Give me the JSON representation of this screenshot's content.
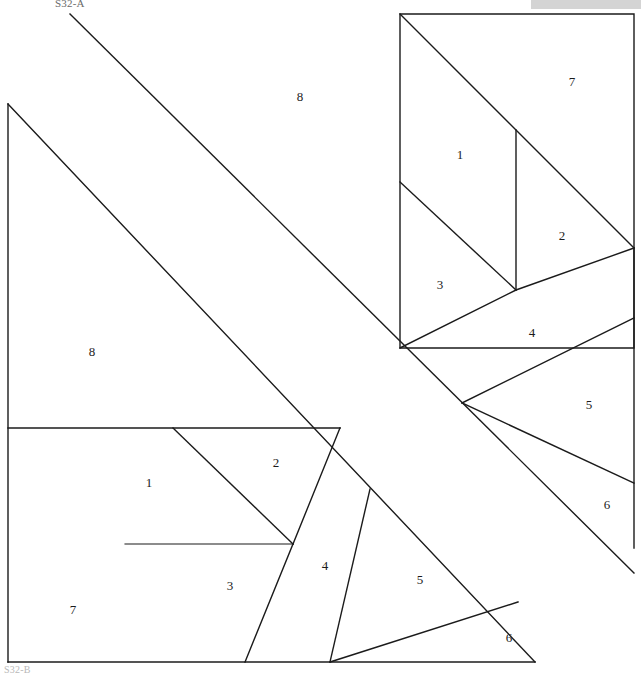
{
  "document": {
    "label_top_left": "S32-A",
    "label_bottom_left": "S32-B",
    "header_bar_color": "#d4d4d4",
    "line_color": "#1b1b1b",
    "background_color": "#ffffff"
  },
  "blocks": [
    {
      "id": "upper-right-block",
      "name": "Upper Right Block",
      "numbers": [
        {
          "label": "1",
          "x": 460,
          "y": 156
        },
        {
          "label": "2",
          "x": 562,
          "y": 237
        },
        {
          "label": "3",
          "x": 440,
          "y": 286
        },
        {
          "label": "4",
          "x": 532,
          "y": 334
        },
        {
          "label": "5",
          "x": 589,
          "y": 406
        },
        {
          "label": "6",
          "x": 607,
          "y": 506
        },
        {
          "label": "7",
          "x": 572,
          "y": 83
        },
        {
          "label": "8",
          "x": 300,
          "y": 98
        }
      ]
    },
    {
      "id": "lower-left-block",
      "name": "Lower Left Block",
      "numbers": [
        {
          "label": "1",
          "x": 149,
          "y": 484
        },
        {
          "label": "2",
          "x": 276,
          "y": 464
        },
        {
          "label": "3",
          "x": 230,
          "y": 587
        },
        {
          "label": "4",
          "x": 325,
          "y": 567
        },
        {
          "label": "5",
          "x": 420,
          "y": 581
        },
        {
          "label": "6",
          "x": 509,
          "y": 639
        },
        {
          "label": "7",
          "x": 73,
          "y": 611
        },
        {
          "label": "8",
          "x": 92,
          "y": 353
        }
      ]
    }
  ],
  "geometry": {
    "upper_square": {
      "x": 400,
      "y": 14,
      "w": 234,
      "h": 334
    },
    "lower_square": {
      "x": 8,
      "y": 104,
      "w": 527,
      "h": 558
    },
    "note": "two overlapping foundation-piecing square blocks"
  }
}
